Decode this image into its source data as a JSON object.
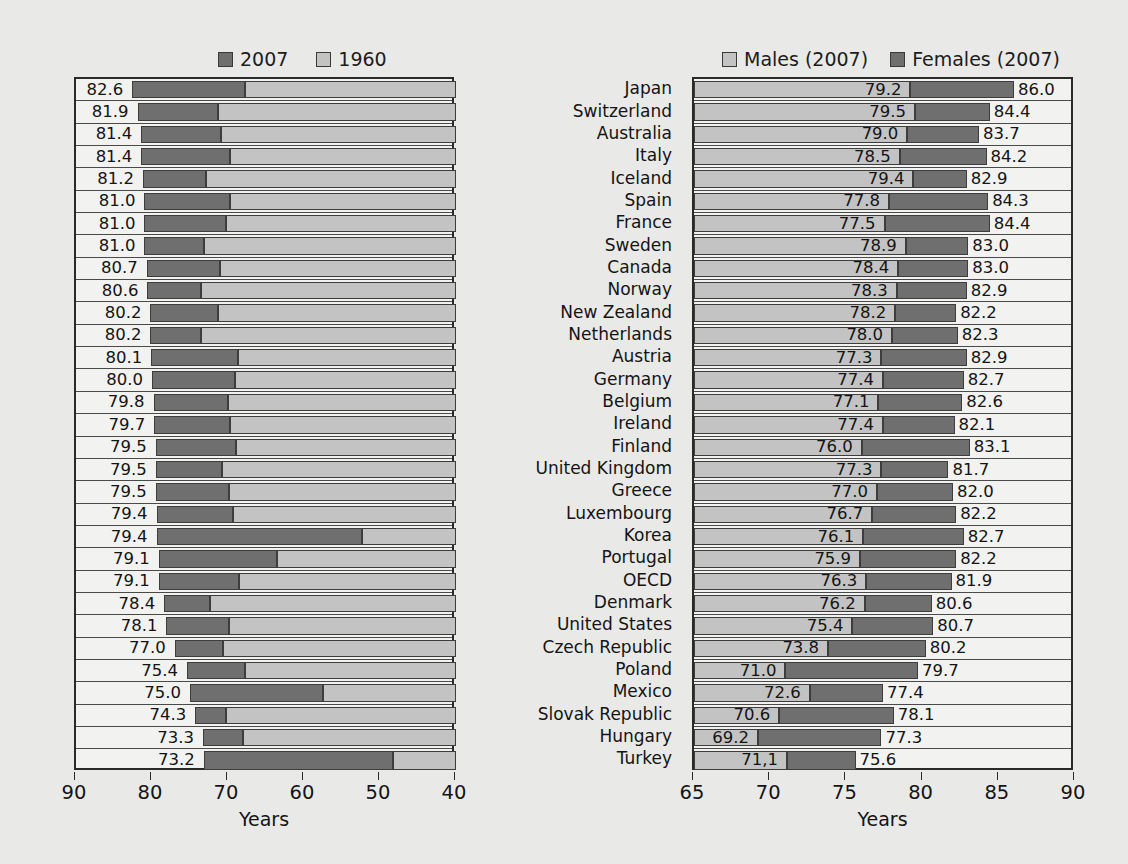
{
  "legend_left": {
    "entries": [
      {
        "label": "2007",
        "swatch": "dark-swatch-icon",
        "color": "#6f6f6f"
      },
      {
        "label": "1960",
        "swatch": "light-swatch-icon",
        "color": "#c3c3c3"
      }
    ]
  },
  "legend_right": {
    "entries": [
      {
        "label": "Males (2007)",
        "swatch": "light-swatch-icon",
        "color": "#c3c3c3"
      },
      {
        "label": "Females (2007)",
        "swatch": "dark-swatch-icon",
        "color": "#6f6f6f"
      }
    ]
  },
  "axis_left": {
    "title": "Years",
    "ticks": [
      90,
      80,
      70,
      60,
      50,
      40
    ],
    "min": 40,
    "max": 90,
    "reversed": true
  },
  "axis_right": {
    "title": "Years",
    "ticks": [
      65,
      70,
      75,
      80,
      85,
      90
    ],
    "min": 65,
    "max": 90,
    "reversed": false
  },
  "countries": [
    "Japan",
    "Switzerland",
    "Australia",
    "Italy",
    "Iceland",
    "Spain",
    "France",
    "Sweden",
    "Canada",
    "Norway",
    "New Zealand",
    "Netherlands",
    "Austria",
    "Germany",
    "Belgium",
    "Ireland",
    "Finland",
    "United Kingdom",
    "Greece",
    "Luxembourg",
    "Korea",
    "Portugal",
    "OECD",
    "Denmark",
    "United States",
    "Czech Republic",
    "Poland",
    "Mexico",
    "Slovak Republic",
    "Hungary",
    "Turkey"
  ],
  "chart_data": [
    {
      "type": "bar",
      "id": "total-life-expectancy",
      "title": "",
      "xlabel": "Years",
      "ylabel": "",
      "xlim": [
        90,
        40
      ],
      "axis_reversed": true,
      "orientation": "horizontal-stacked",
      "grid": false,
      "legend_position": "top",
      "categories": [
        "Japan",
        "Switzerland",
        "Australia",
        "Italy",
        "Iceland",
        "Spain",
        "France",
        "Sweden",
        "Canada",
        "Norway",
        "New Zealand",
        "Netherlands",
        "Austria",
        "Germany",
        "Belgium",
        "Ireland",
        "Finland",
        "United Kingdom",
        "Greece",
        "Luxembourg",
        "Korea",
        "Portugal",
        "OECD",
        "Denmark",
        "United States",
        "Czech Republic",
        "Poland",
        "Mexico",
        "Slovak Republic",
        "Hungary",
        "Turkey"
      ],
      "series": [
        {
          "name": "2007",
          "color": "#6f6f6f",
          "values": [
            82.6,
            81.9,
            81.4,
            81.4,
            81.2,
            81.0,
            81.0,
            81.0,
            80.7,
            80.6,
            80.2,
            80.2,
            80.1,
            80.0,
            79.8,
            79.7,
            79.5,
            79.5,
            79.5,
            79.4,
            79.4,
            79.1,
            79.1,
            78.4,
            78.1,
            77.0,
            75.4,
            75.0,
            74.3,
            73.3,
            73.2
          ],
          "labels": [
            "82.6",
            "81.9",
            "81.4",
            "81.4",
            "81.2",
            "81.0",
            "81.0",
            "81.0",
            "80.7",
            "80.6",
            "80.2",
            "80.2",
            "80.1",
            "80.0",
            "79.8",
            "79.7",
            "79.5",
            "79.5",
            "79.5",
            "79.4",
            "79.4",
            "79.1",
            "79.1",
            "78.4",
            "78.1",
            "77.0",
            "75.4",
            "75.0",
            "74.3",
            "73.3",
            "73.2"
          ]
        },
        {
          "name": "1960",
          "color": "#c3c3c3",
          "values": [
            67.8,
            71.3,
            70.9,
            69.8,
            72.9,
            69.8,
            70.3,
            73.1,
            71.1,
            73.6,
            71.3,
            73.5,
            68.7,
            69.1,
            70.0,
            69.8,
            69.0,
            70.8,
            69.9,
            69.4,
            52.4,
            63.6,
            68.5,
            72.4,
            69.9,
            70.7,
            67.8,
            57.5,
            70.3,
            68.0,
            48.3
          ],
          "labels": []
        }
      ]
    },
    {
      "type": "bar",
      "id": "life-expectancy-by-gender",
      "title": "",
      "xlabel": "Years",
      "ylabel": "",
      "xlim": [
        65,
        90
      ],
      "axis_reversed": false,
      "orientation": "horizontal-stacked",
      "grid": false,
      "legend_position": "top",
      "categories": [
        "Japan",
        "Switzerland",
        "Australia",
        "Italy",
        "Iceland",
        "Spain",
        "France",
        "Sweden",
        "Canada",
        "Norway",
        "New Zealand",
        "Netherlands",
        "Austria",
        "Germany",
        "Belgium",
        "Ireland",
        "Finland",
        "United Kingdom",
        "Greece",
        "Luxembourg",
        "Korea",
        "Portugal",
        "OECD",
        "Denmark",
        "United States",
        "Czech Republic",
        "Poland",
        "Mexico",
        "Slovak Republic",
        "Hungary",
        "Turkey"
      ],
      "series": [
        {
          "name": "Males (2007)",
          "color": "#c3c3c3",
          "values": [
            79.2,
            79.5,
            79.0,
            78.5,
            79.4,
            77.8,
            77.5,
            78.9,
            78.4,
            78.3,
            78.2,
            78.0,
            77.3,
            77.4,
            77.1,
            77.4,
            76.0,
            77.3,
            77.0,
            76.7,
            76.1,
            75.9,
            76.3,
            76.2,
            75.4,
            73.8,
            71.0,
            72.6,
            70.6,
            69.2,
            71.1
          ],
          "labels": [
            "79.2",
            "79.5",
            "79.0",
            "78.5",
            "79.4",
            "77.8",
            "77.5",
            "78.9",
            "78.4",
            "78.3",
            "78.2",
            "78.0",
            "77.3",
            "77.4",
            "77.1",
            "77.4",
            "76.0",
            "77.3",
            "77.0",
            "76.7",
            "76.1",
            "75.9",
            "76.3",
            "76.2",
            "75.4",
            "73.8",
            "71.0",
            "72.6",
            "70.6",
            "69.2",
            "71,1"
          ]
        },
        {
          "name": "Females (2007)",
          "color": "#6f6f6f",
          "values": [
            86.0,
            84.4,
            83.7,
            84.2,
            82.9,
            84.3,
            84.4,
            83.0,
            83.0,
            82.9,
            82.2,
            82.3,
            82.9,
            82.7,
            82.6,
            82.1,
            83.1,
            81.7,
            82.0,
            82.2,
            82.7,
            82.2,
            81.9,
            80.6,
            80.7,
            80.2,
            79.7,
            77.4,
            78.1,
            77.3,
            75.6
          ],
          "labels": [
            "86.0",
            "84.4",
            "83.7",
            "84.2",
            "82.9",
            "84.3",
            "84.4",
            "83.0",
            "83.0",
            "82.9",
            "82.2",
            "82.3",
            "82.9",
            "82.7",
            "82.6",
            "82.1",
            "83.1",
            "81.7",
            "82.0",
            "82.2",
            "82.7",
            "82.2",
            "81.9",
            "80.6",
            "80.7",
            "80.2",
            "79.7",
            "77.4",
            "78.1",
            "77.3",
            "75.6"
          ]
        }
      ]
    }
  ]
}
